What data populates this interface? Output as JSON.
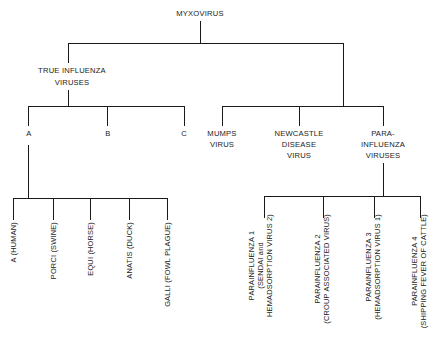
{
  "diagram": {
    "type": "classification-tree",
    "root": {
      "label": "MYXOVIRUS",
      "children": [
        {
          "label_lines": [
            "TRUE INFLUENZA",
            "VIRUSES"
          ],
          "children": [
            {
              "label": "A",
              "children": [
                {
                  "label": "A (HUMAN)"
                },
                {
                  "label": "PORCI (SWINE)"
                },
                {
                  "label": "EQUI (HORSE)"
                },
                {
                  "label": "ANATIS (DUCK)"
                },
                {
                  "label": "GALLI (FOWL PLAGUE)"
                }
              ]
            },
            {
              "label": "B"
            },
            {
              "label": "C"
            }
          ]
        },
        {
          "label_lines": [
            "MUMPS",
            "VIRUS"
          ]
        },
        {
          "label_lines": [
            "NEWCASTLE",
            "DISEASE",
            "VIRUS"
          ]
        },
        {
          "label_lines": [
            "PARA-",
            "INFLUENZA",
            "VIRUSES"
          ],
          "children": [
            {
              "label_lines": [
                "PARAINFLUENZA 1",
                "(SENDAI and",
                "HEMADSORPTION VIRUS 2)"
              ]
            },
            {
              "label_lines": [
                "PARAINFLUENZA 2",
                "(CROUP ASSOCIATED VIRUS)"
              ]
            },
            {
              "label_lines": [
                "PARAINFLUENZA 3",
                "(HEMADSORPTION VIRUS 1)"
              ]
            },
            {
              "label_lines": [
                "PARAINFLUENZA 4",
                "(SHIPPING FEVER OF CATTLE)"
              ]
            }
          ]
        }
      ]
    }
  },
  "colors": {
    "line": "#1a1a1a",
    "background": "#ffffff",
    "text": "#1a1a1a"
  }
}
